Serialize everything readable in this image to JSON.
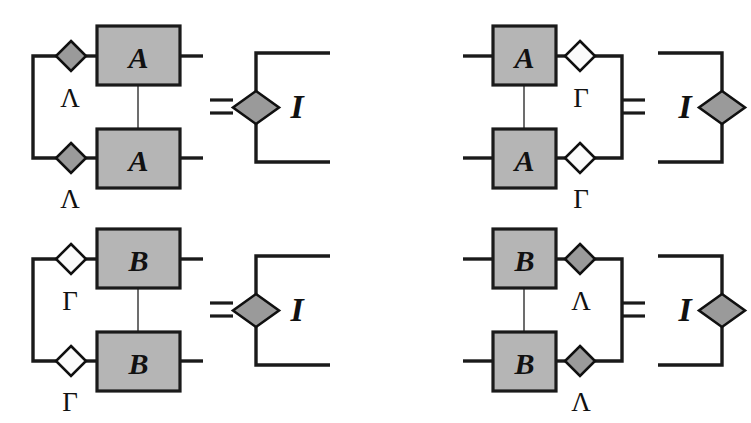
{
  "figure": {
    "type": "tensor-network-diagram",
    "background_color": "#ffffff",
    "colors": {
      "tensor_box_fill": "#b5b5b5",
      "filled_node_fill": "#9a9a9a",
      "open_node_fill": "#fbfbfb",
      "stroke": "#1a1a1a",
      "inner_wire": "#6d6d6d"
    },
    "equations": [
      {
        "id": "eq-top-left",
        "position": "top-left",
        "orientation": "left-contraction",
        "relation": "=",
        "lhs": {
          "tensors": [
            {
              "label": "A",
              "row": "upper"
            },
            {
              "label": "A",
              "row": "lower"
            }
          ],
          "nodes": [
            {
              "label": "Λ",
              "style": "filled",
              "row": "upper"
            },
            {
              "label": "Λ",
              "style": "filled",
              "row": "lower"
            }
          ],
          "contraction_side": "left",
          "free_leg_side": "right"
        },
        "rhs": {
          "node": {
            "label": "",
            "style": "filled"
          },
          "identity_label": "I",
          "bracket_opening": "right"
        }
      },
      {
        "id": "eq-top-right",
        "position": "top-right",
        "orientation": "right-contraction",
        "relation": "=",
        "lhs": {
          "tensors": [
            {
              "label": "A",
              "row": "upper"
            },
            {
              "label": "A",
              "row": "lower"
            }
          ],
          "nodes": [
            {
              "label": "Γ",
              "style": "open",
              "row": "upper"
            },
            {
              "label": "Γ",
              "style": "open",
              "row": "lower"
            }
          ],
          "contraction_side": "right",
          "free_leg_side": "left"
        },
        "rhs": {
          "node": {
            "label": "",
            "style": "filled"
          },
          "identity_label": "I",
          "bracket_opening": "left"
        }
      },
      {
        "id": "eq-bottom-left",
        "position": "bottom-left",
        "orientation": "left-contraction",
        "relation": "=",
        "lhs": {
          "tensors": [
            {
              "label": "B",
              "row": "upper"
            },
            {
              "label": "B",
              "row": "lower"
            }
          ],
          "nodes": [
            {
              "label": "Γ",
              "style": "open",
              "row": "upper"
            },
            {
              "label": "Γ",
              "style": "open",
              "row": "lower"
            }
          ],
          "contraction_side": "left",
          "free_leg_side": "right"
        },
        "rhs": {
          "node": {
            "label": "",
            "style": "filled"
          },
          "identity_label": "I",
          "bracket_opening": "right"
        }
      },
      {
        "id": "eq-bottom-right",
        "position": "bottom-right",
        "orientation": "right-contraction",
        "relation": "=",
        "lhs": {
          "tensors": [
            {
              "label": "B",
              "row": "upper"
            },
            {
              "label": "B",
              "row": "lower"
            }
          ],
          "nodes": [
            {
              "label": "Λ",
              "style": "filled",
              "row": "upper"
            },
            {
              "label": "Λ",
              "style": "filled",
              "row": "lower"
            }
          ],
          "contraction_side": "right",
          "free_leg_side": "left"
        },
        "rhs": {
          "node": {
            "label": "",
            "style": "filled"
          },
          "identity_label": "I",
          "bracket_opening": "left"
        }
      }
    ],
    "labels": {
      "tensor_a": "A",
      "tensor_b": "B",
      "lambda": "Λ",
      "gamma": "Γ",
      "identity": "I",
      "equals": "="
    }
  }
}
